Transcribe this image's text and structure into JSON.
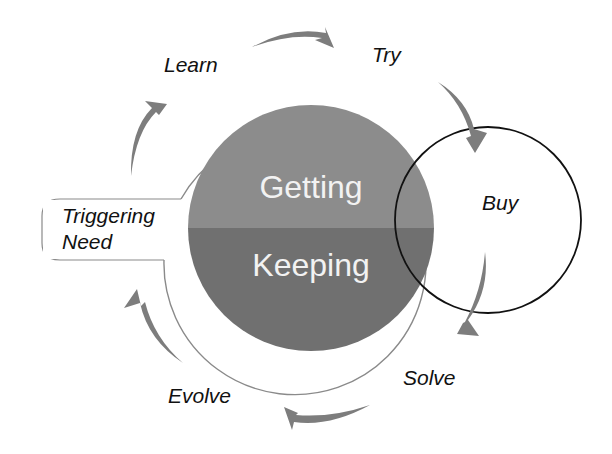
{
  "diagram": {
    "type": "customer-lifecycle-cycle",
    "core": {
      "top_label": "Getting",
      "bottom_label": "Keeping"
    },
    "entry": {
      "label_line1": "Triggering",
      "label_line2": "Need"
    },
    "stages": [
      {
        "id": "learn",
        "label": "Learn"
      },
      {
        "id": "try",
        "label": "Try"
      },
      {
        "id": "buy",
        "label": "Buy"
      },
      {
        "id": "solve",
        "label": "Solve"
      },
      {
        "id": "evolve",
        "label": "Evolve"
      }
    ],
    "highlight_stage": "Buy",
    "flow_direction": "clockwise",
    "colors": {
      "background": "#ffffff",
      "core_top": "#8c8c8c",
      "core_bottom": "#707070",
      "ring_stroke": "#8a8a8a",
      "arrow_fill": "#7d7d7d",
      "highlight_circle_stroke": "#111111",
      "stage_text": "#111111",
      "core_text": "#f2f2f2"
    }
  }
}
